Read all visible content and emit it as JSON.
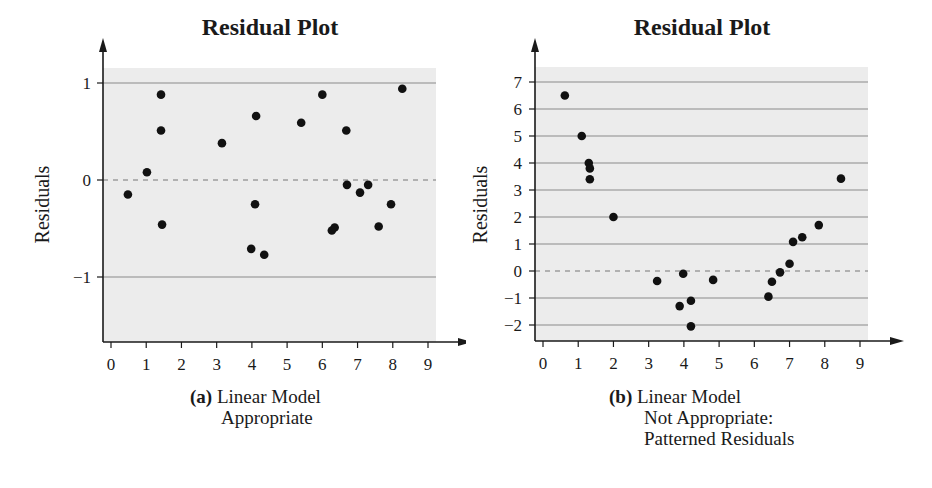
{
  "chart_data": [
    {
      "id": "a",
      "type": "scatter",
      "title": "Residual Plot",
      "xlabel": "",
      "ylabel": "Residuals",
      "caption_bold": "(a)",
      "caption_lines": [
        "Linear Model",
        "Appropriate"
      ],
      "xlim": [
        0,
        9
      ],
      "ylim": [
        -1.65,
        1.15
      ],
      "x_ticks": [
        0,
        1,
        2,
        3,
        4,
        5,
        6,
        7,
        8,
        9
      ],
      "y_ticks": [
        1,
        0,
        -1
      ],
      "y_tick_labels": [
        "1",
        "0",
        "−1"
      ],
      "grid": "horizontal at y=1 and y=-1; dashed reference at y=0",
      "points": [
        [
          0.48,
          -0.15
        ],
        [
          1.02,
          0.08
        ],
        [
          1.42,
          0.88
        ],
        [
          1.42,
          0.51
        ],
        [
          1.45,
          -0.46
        ],
        [
          3.15,
          0.38
        ],
        [
          3.98,
          -0.71
        ],
        [
          4.12,
          0.66
        ],
        [
          4.09,
          -0.25
        ],
        [
          4.35,
          -0.77
        ],
        [
          5.4,
          0.59
        ],
        [
          6.0,
          0.88
        ],
        [
          6.27,
          -0.52
        ],
        [
          6.35,
          -0.49
        ],
        [
          6.7,
          -0.05
        ],
        [
          6.68,
          0.51
        ],
        [
          7.07,
          -0.13
        ],
        [
          7.3,
          -0.05
        ],
        [
          7.6,
          -0.48
        ],
        [
          7.95,
          -0.25
        ],
        [
          8.27,
          0.94
        ]
      ]
    },
    {
      "id": "b",
      "type": "scatter",
      "title": "Residual Plot",
      "xlabel": "",
      "ylabel": "Residuals",
      "caption_bold": "(b)",
      "caption_lines": [
        "Linear Model",
        "Not Appropriate:",
        "Patterned Residuals"
      ],
      "xlim": [
        0,
        9
      ],
      "ylim": [
        -2.55,
        7.55
      ],
      "x_ticks": [
        0,
        1,
        2,
        3,
        4,
        5,
        6,
        7,
        8,
        9
      ],
      "y_ticks": [
        7,
        6,
        5,
        4,
        3,
        2,
        1,
        0,
        -1,
        -2
      ],
      "y_tick_labels": [
        "7",
        "6",
        "5",
        "4",
        "3",
        "2",
        "1",
        "0",
        "−1",
        "−2"
      ],
      "grid": "horizontal at every integer; dashed reference at y=0",
      "points": [
        [
          0.62,
          6.5
        ],
        [
          1.1,
          5.0
        ],
        [
          1.3,
          4.0
        ],
        [
          1.33,
          3.8
        ],
        [
          1.33,
          3.4
        ],
        [
          2.0,
          2.0
        ],
        [
          3.24,
          -0.37
        ],
        [
          3.98,
          -0.1
        ],
        [
          3.88,
          -1.3
        ],
        [
          4.2,
          -1.1
        ],
        [
          4.2,
          -2.05
        ],
        [
          4.83,
          -0.33
        ],
        [
          6.4,
          -0.95
        ],
        [
          6.5,
          -0.4
        ],
        [
          6.73,
          -0.05
        ],
        [
          7.0,
          0.27
        ],
        [
          7.1,
          1.08
        ],
        [
          7.36,
          1.25
        ],
        [
          7.83,
          1.7
        ],
        [
          8.46,
          3.42
        ]
      ]
    }
  ],
  "colors": {
    "plot_background": "#ececec",
    "gridline": "#8a8a8a",
    "axis": "#1a1a1a",
    "point": "#111111"
  }
}
